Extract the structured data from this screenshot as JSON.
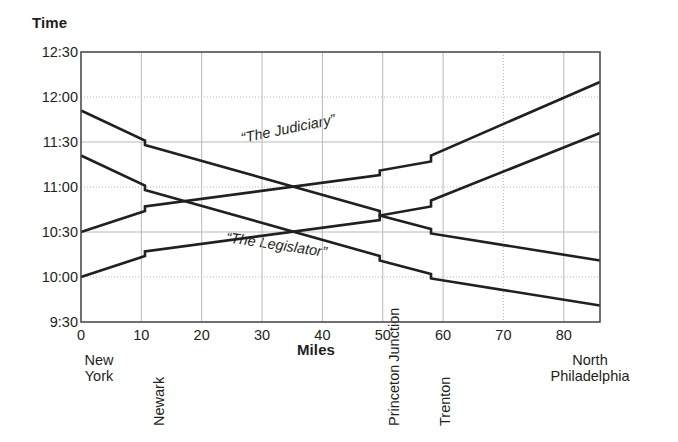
{
  "chart_data": {
    "type": "line",
    "title": "",
    "xlabel": "Miles",
    "ylabel": "Time",
    "xlim": [
      0,
      86
    ],
    "ylim_times": [
      "9:30",
      "12:30"
    ],
    "grid": true,
    "legend_position": "inline-annotation",
    "x_ticks": [
      0,
      10,
      20,
      30,
      40,
      50,
      60,
      70,
      80
    ],
    "x_tick_labels": [
      "0",
      "10",
      "20",
      "30",
      "40",
      "50",
      "60",
      "70",
      "80"
    ],
    "y_ticks": [
      "9:30",
      "10:00",
      "10:30",
      "11:00",
      "11:30",
      "12:00",
      "12:30"
    ],
    "y_tick_labels": [
      "12:30",
      "12:00",
      "11:30",
      "11:00",
      "10:30",
      "10:00",
      "9:30"
    ],
    "stations": [
      {
        "name": "New York",
        "mile": 0,
        "label_style": "horizontal",
        "lines": [
          "New",
          "York"
        ]
      },
      {
        "name": "Newark",
        "mile": 10.6,
        "label_style": "vertical",
        "lines": [
          "Newark"
        ]
      },
      {
        "name": "Princeton Junction",
        "mile": 49.5,
        "label_style": "vertical",
        "lines": [
          "Princeton",
          "Junction"
        ]
      },
      {
        "name": "Trenton",
        "mile": 58,
        "label_style": "vertical",
        "lines": [
          "Trenton"
        ]
      },
      {
        "name": "North Philadelphia",
        "mile": 86,
        "label_style": "horizontal",
        "lines": [
          "North",
          "Philadelphia"
        ]
      }
    ],
    "annotations": [
      {
        "text": "“The Judiciary”",
        "mile": 34.5,
        "time": "11:33",
        "rotation": -11.5
      },
      {
        "text": "“The Legislator”",
        "mile": 32.5,
        "time": "10:27",
        "rotation": 8.5
      }
    ],
    "series": [
      {
        "name": "The Judiciary",
        "direction": "southbound",
        "points": [
          {
            "mile": 0,
            "time": "11:51"
          },
          {
            "mile": 10.6,
            "time": "11:31"
          },
          {
            "mile": 10.6,
            "time": "11:28"
          },
          {
            "mile": 49.5,
            "time": "10:44"
          },
          {
            "mile": 49.5,
            "time": "10:41"
          },
          {
            "mile": 58,
            "time": "10:32"
          },
          {
            "mile": 58,
            "time": "10:29"
          },
          {
            "mile": 86,
            "time": "10:11"
          }
        ]
      },
      {
        "name": "The Legislator",
        "direction": "southbound",
        "points": [
          {
            "mile": 0,
            "time": "11:21"
          },
          {
            "mile": 10.6,
            "time": "11:01"
          },
          {
            "mile": 10.6,
            "time": "10:58"
          },
          {
            "mile": 49.5,
            "time": "10:14"
          },
          {
            "mile": 49.5,
            "time": "10:11"
          },
          {
            "mile": 58,
            "time": "10:02"
          },
          {
            "mile": 58,
            "time": "9:59"
          },
          {
            "mile": 86,
            "time": "9:41"
          }
        ]
      },
      {
        "name": "Northbound train 1",
        "direction": "northbound",
        "points": [
          {
            "mile": 0,
            "time": "10:30"
          },
          {
            "mile": 10.6,
            "time": "10:44"
          },
          {
            "mile": 10.6,
            "time": "10:47"
          },
          {
            "mile": 49.5,
            "time": "11:08"
          },
          {
            "mile": 49.5,
            "time": "11:11"
          },
          {
            "mile": 58,
            "time": "11:17"
          },
          {
            "mile": 58,
            "time": "11:21"
          },
          {
            "mile": 86,
            "time": "12:10"
          }
        ]
      },
      {
        "name": "Northbound train 2",
        "direction": "northbound",
        "points": [
          {
            "mile": 0,
            "time": "10:00"
          },
          {
            "mile": 10.6,
            "time": "10:14"
          },
          {
            "mile": 10.6,
            "time": "10:17"
          },
          {
            "mile": 49.5,
            "time": "10:38"
          },
          {
            "mile": 49.5,
            "time": "10:41"
          },
          {
            "mile": 58,
            "time": "10:47"
          },
          {
            "mile": 58,
            "time": "10:51"
          },
          {
            "mile": 86,
            "time": "11:36"
          }
        ]
      }
    ],
    "colors": {
      "line": "#231f20",
      "grid": "#b9b9b9",
      "frame": "#4d4d4d",
      "background": "#ffffff",
      "text": "#231f20"
    }
  }
}
